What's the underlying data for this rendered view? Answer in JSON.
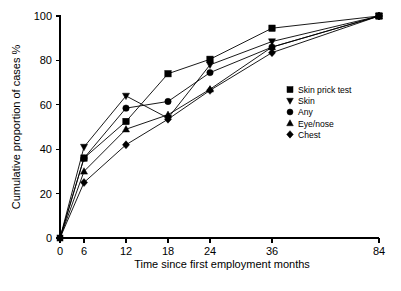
{
  "chart_data": {
    "type": "line",
    "title": "",
    "xlabel": "Time since first employment months",
    "ylabel": "Cumulative proportion of cases %",
    "x": [
      0,
      6,
      12,
      18,
      24,
      36,
      84
    ],
    "xtick_labels": [
      "0",
      "6",
      "12",
      "18",
      "24",
      "36",
      "84"
    ],
    "ytick_labels": [
      "0",
      "20",
      "40",
      "60",
      "80",
      "100"
    ],
    "yticks": [
      0,
      20,
      40,
      60,
      80,
      100
    ],
    "ylim": [
      0,
      100
    ],
    "grid": false,
    "legend_position": "right",
    "series": [
      {
        "name": "Skin prick test",
        "marker": "square",
        "values": [
          0,
          36,
          52.5,
          74,
          80.5,
          94.5,
          100
        ]
      },
      {
        "name": "Skin",
        "marker": "triangle-down",
        "values": [
          0,
          41,
          64,
          54,
          78,
          88.5,
          100
        ]
      },
      {
        "name": "Any",
        "marker": "circle",
        "values": [
          0,
          36,
          58.5,
          61.5,
          74.5,
          86,
          100
        ]
      },
      {
        "name": "Eye/nose",
        "marker": "triangle-up",
        "values": [
          0,
          30,
          49,
          55.5,
          67,
          86,
          100
        ]
      },
      {
        "name": "Chest",
        "marker": "diamond",
        "values": [
          0,
          25,
          42,
          53.5,
          66.5,
          83.5,
          100
        ]
      }
    ]
  },
  "legend": {
    "items": [
      {
        "label": "Skin prick test",
        "marker": "square"
      },
      {
        "label": "Skin",
        "marker": "triangle-down"
      },
      {
        "label": "Any",
        "marker": "circle"
      },
      {
        "label": "Eye/nose",
        "marker": "triangle-up"
      },
      {
        "label": "Chest",
        "marker": "diamond"
      }
    ]
  },
  "colors": {
    "ink": "#000000",
    "background": "#ffffff"
  }
}
